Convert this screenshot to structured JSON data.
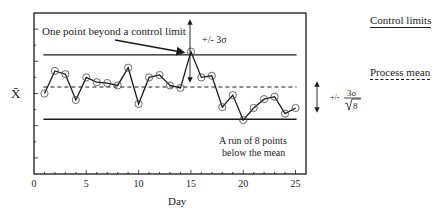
{
  "chart_data": {
    "type": "line",
    "title": "",
    "xlabel": "Day",
    "ylabel": "X̄",
    "xlim": [
      0,
      26
    ],
    "ylim": [
      0,
      10
    ],
    "x_ticks": [
      0,
      5,
      10,
      15,
      20,
      25
    ],
    "x_tick_labels": [
      "0",
      "5",
      "10",
      "15",
      "20",
      "25"
    ],
    "y_tick_labels": [],
    "grid": false,
    "series": [
      {
        "name": "Daily mean",
        "marker": "open-circle",
        "x": [
          1,
          2,
          3,
          4,
          5,
          6,
          7,
          8,
          9,
          10,
          11,
          12,
          13,
          14,
          15,
          16,
          17,
          18,
          19,
          20,
          21,
          22,
          23,
          24,
          25
        ],
        "values": [
          5.0,
          6.4,
          6.2,
          4.6,
          6.0,
          5.7,
          5.65,
          5.5,
          6.6,
          4.35,
          6.0,
          6.15,
          5.5,
          5.35,
          7.6,
          6.0,
          6.1,
          4.15,
          4.9,
          3.35,
          4.1,
          4.65,
          4.8,
          3.75,
          4.1
        ]
      }
    ],
    "reference_lines": {
      "upper_control_limit": 7.4,
      "process_mean": 5.4,
      "lower_control_limit": 3.4
    },
    "annotations": {
      "beyond_limit": "One point beyond a control limit",
      "sigma_label": "+/-  3σ",
      "run_line1": "A run of 8 points",
      "run_line2": "below the mean",
      "sigma_root_prefix": "+/-",
      "sigma_root_num": "3σ",
      "sigma_root_den": "8"
    },
    "legend": {
      "placement": "right",
      "control_limits": "Control limits",
      "process_mean": "Process mean"
    }
  }
}
